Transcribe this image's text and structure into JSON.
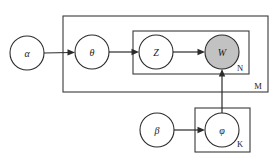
{
  "diagram": {
    "type": "plate-notation-bayesian-network",
    "background_color": "#ffffff",
    "stroke_color": "#2b2b2b",
    "observed_fill_color": "#c2c2c2",
    "latent_fill_color": "#ffffff",
    "nodes": [
      {
        "id": "alpha",
        "label": "α",
        "name": "alpha",
        "observed": false,
        "cx": 27,
        "cy": 53,
        "r": 17
      },
      {
        "id": "theta",
        "label": "θ",
        "name": "theta",
        "observed": false,
        "cx": 92,
        "cy": 52,
        "r": 17
      },
      {
        "id": "z",
        "label": "Z",
        "name": "z",
        "observed": false,
        "cx": 156,
        "cy": 52,
        "r": 17
      },
      {
        "id": "w",
        "label": "W",
        "name": "w",
        "observed": true,
        "cx": 222,
        "cy": 52,
        "r": 17
      },
      {
        "id": "beta",
        "label": "β",
        "name": "beta",
        "observed": false,
        "cx": 157,
        "cy": 130,
        "r": 17
      },
      {
        "id": "phi",
        "label": "φ",
        "name": "phi",
        "observed": false,
        "cx": 222,
        "cy": 130,
        "r": 17
      }
    ],
    "plates": [
      {
        "id": "M",
        "label": "M",
        "name": "plate-m",
        "x": 63,
        "y": 16,
        "width": 205,
        "height": 76,
        "label_x": 258,
        "label_y": 86
      },
      {
        "id": "N",
        "label": "N",
        "name": "plate-n",
        "x": 133,
        "y": 31,
        "width": 116,
        "height": 43,
        "label_x": 240,
        "label_y": 68
      },
      {
        "id": "K",
        "label": "K",
        "name": "plate-k",
        "x": 195,
        "y": 108,
        "width": 55,
        "height": 44,
        "label_x": 240,
        "label_y": 144
      }
    ],
    "edges": [
      {
        "id": "alpha-theta",
        "from": "alpha",
        "to": "theta",
        "name": "edge-alpha-to-theta"
      },
      {
        "id": "theta-z",
        "from": "theta",
        "to": "z",
        "name": "edge-theta-to-z"
      },
      {
        "id": "z-w",
        "from": "z",
        "to": "w",
        "name": "edge-z-to-w"
      },
      {
        "id": "beta-phi",
        "from": "beta",
        "to": "phi",
        "name": "edge-beta-to-phi"
      },
      {
        "id": "phi-w",
        "from": "phi",
        "to": "w",
        "name": "edge-phi-to-w"
      }
    ]
  }
}
